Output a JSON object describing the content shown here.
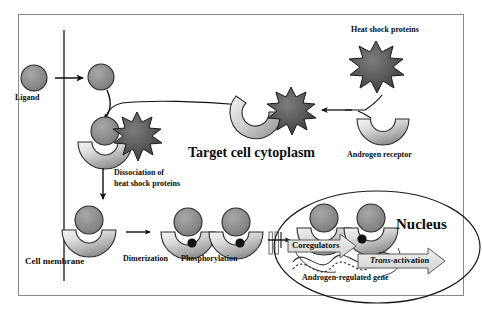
{
  "figure": {
    "title_region": "Androgen receptor signaling pathway schematic",
    "background_color": "#ffffff",
    "frame_border_color": "#8a8a8a"
  },
  "palette": {
    "ligand_fill": "#8c8c8c",
    "ligand_stroke": "#2b2b2b",
    "receptor_light": "#efefef",
    "receptor_mid": "#b9b9b9",
    "receptor_dark": "#8f8f8f",
    "hsp_fill": "#585858",
    "hsp_stroke": "#1a1a1a",
    "phospho_fill": "#121212",
    "arrow_stroke": "#111111",
    "outline_arrow_fill": "#e3e3e3",
    "text_color": "#0d0d0d"
  },
  "labels": {
    "ligand": "Ligand",
    "cell_membrane": "Cell membrane",
    "heat_shock_proteins": "Heat shock proteins",
    "androgen_receptor": "Androgen receptor",
    "target_cell_cytoplasm": "Target cell cytoplasm",
    "dissociation_line1": "Dissociation of",
    "dissociation_line2": "heat shock proteins",
    "dimerization": "Dimerization",
    "phosphorylation": "Phosphorylation",
    "nucleus": "Nucleus",
    "coregulators": "Coregulators",
    "trans_activation_italic": "Trans",
    "trans_activation_rest": "-activation",
    "androgen_regulated_gene": "Androgen-regulated gene"
  },
  "elements": {
    "ligand_extracellular": {
      "cx": 34,
      "cy": 78,
      "r": 13
    },
    "ligand_intracellular": {
      "cx": 101,
      "cy": 77,
      "r": 13
    },
    "ligand_bound": {
      "cx": 105,
      "cy": 131,
      "r": 14
    },
    "receptor_bound_cytoplasm": {
      "cx": 104,
      "cy": 142
    },
    "receptor_free_right": {
      "cx": 383,
      "cy": 125
    },
    "receptor_hsp_complex": {
      "cx": 262,
      "cy": 110
    },
    "receptor_dissociated": {
      "cx": 89,
      "cy": 230
    },
    "dimer_left": {
      "cx": 188,
      "cy": 232
    },
    "dimer_right": {
      "cx": 236,
      "cy": 232
    },
    "nuclear_dimer_left": {
      "cx": 324,
      "cy": 228
    },
    "nuclear_dimer_right": {
      "cx": 371,
      "cy": 228
    },
    "hsp_top_right": {
      "cx": 376,
      "cy": 66
    },
    "hsp_complex": {
      "cx": 291,
      "cy": 113
    },
    "hsp_bound_cytoplasm": {
      "cx": 137,
      "cy": 137
    },
    "nucleus_ellipse": {
      "cx": 377,
      "cy": 247,
      "rx": 103,
      "ry": 56
    }
  },
  "flow_steps": [
    "Ligand crosses cell membrane",
    "Ligand binds androgen receptor bound to heat shock proteins",
    "Dissociation of heat shock proteins",
    "Dimerization",
    "Phosphorylation",
    "Nuclear translocation and coregulator binding",
    "Trans-activation of androgen-regulated gene"
  ]
}
